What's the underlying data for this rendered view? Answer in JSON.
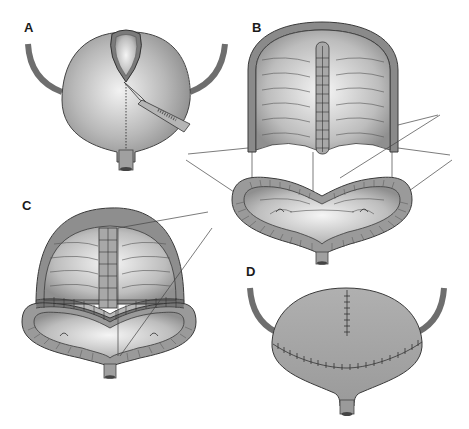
{
  "figure": {
    "panels": [
      {
        "id": "A",
        "label": "A",
        "description": "Bladder with dome incision and scalpel, dotted line marking extension of incision"
      },
      {
        "id": "B",
        "label": "B",
        "description": "Opened bladder dome with mucosal strip and bivalved base showing ureteric orifices"
      },
      {
        "id": "C",
        "label": "C",
        "description": "Dome folded down onto base with circumferential suture line"
      },
      {
        "id": "D",
        "label": "D",
        "description": "Closed bladder with vertical and horizontal suture lines"
      }
    ],
    "colors": {
      "tissue_dark": "#7a7a7a",
      "tissue_mid": "#a8a8a8",
      "tissue_light": "#e6e6e6",
      "outline": "#3a3a3a",
      "ureter": "#6e6e6e"
    }
  }
}
